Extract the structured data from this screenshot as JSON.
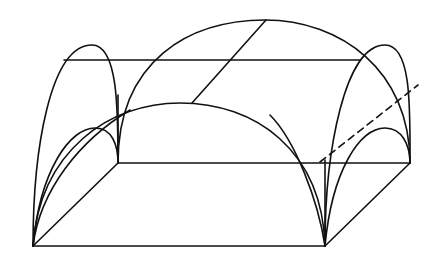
{
  "diagram": {
    "title": "",
    "type": "line-drawing",
    "stroke_color": "#111111",
    "background_color": "#ffffff",
    "elements": [
      {
        "name": "base-front-edge",
        "kind": "line"
      },
      {
        "name": "base-back-edge",
        "kind": "line"
      },
      {
        "name": "base-left-edge",
        "kind": "line"
      },
      {
        "name": "base-right-edge",
        "kind": "line"
      },
      {
        "name": "top-horizontal-line",
        "kind": "line"
      },
      {
        "name": "back-large-arch",
        "kind": "arc"
      },
      {
        "name": "front-large-arch",
        "kind": "arc"
      },
      {
        "name": "left-tall-arch",
        "kind": "arc"
      },
      {
        "name": "right-tall-arch",
        "kind": "arc"
      },
      {
        "name": "left-small-arch",
        "kind": "arc"
      },
      {
        "name": "right-small-arch",
        "kind": "arc"
      },
      {
        "name": "left-groin-curve",
        "kind": "arc"
      },
      {
        "name": "right-groin-curve",
        "kind": "arc"
      },
      {
        "name": "ridge-diagonal-line",
        "kind": "line"
      },
      {
        "name": "dashed-ridge-line",
        "kind": "dashed-line"
      }
    ]
  }
}
